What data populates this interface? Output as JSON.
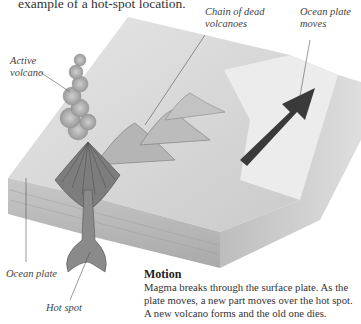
{
  "intro": {
    "text": "example of a hot-spot location."
  },
  "labels": {
    "active_volcano": [
      "Active",
      "volcano"
    ],
    "chain_of_dead_volcanoes": [
      "Chain of dead",
      "volcanoes"
    ],
    "ocean_plate_moves": [
      "Ocean plate",
      "moves"
    ],
    "ocean_plate": "Ocean plate",
    "hot_spot": "Hot spot"
  },
  "motion": {
    "title": "Motion",
    "body": "Magma breaks through the surface plate. As the plate moves, a new part moves over the hot spot. A new volcano forms and the old one dies."
  },
  "colors": {
    "arrow": "#3a3a3a",
    "plate_top": "#d8d8d8",
    "plate_side": "#b8b8b8",
    "magma": "#6a6a6a"
  }
}
